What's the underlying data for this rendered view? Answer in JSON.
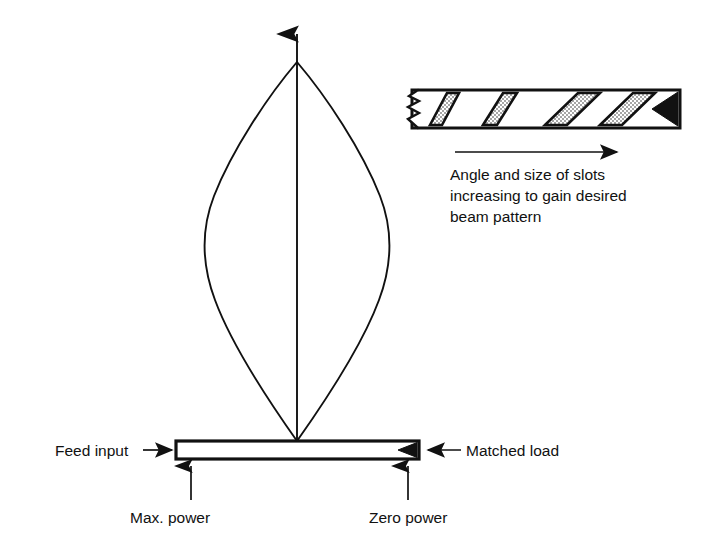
{
  "figure": {
    "type": "technical-diagram",
    "background_color": "#ffffff",
    "ink_color": "#111111"
  },
  "main_diagram": {
    "beam_lobe": {
      "name": "radiation-beam-pattern-lobe",
      "shape": "teardrop",
      "apex_label": null,
      "boresight_arrow": "upward"
    },
    "waveguide": {
      "name": "slotted-waveguide-bar",
      "fill": "#ffffff",
      "stroke": "#111111"
    },
    "labels": {
      "feed_input": "Feed input",
      "matched_load": "Matched load",
      "max_power": "Max. power",
      "zero_power": "Zero power"
    }
  },
  "inset_diagram": {
    "name": "waveguide-slot-detail",
    "break_symbol": "jagged-break",
    "slot_count": 5,
    "slot_fill": "stipple",
    "termination": "black-wedge-matched-load",
    "direction_arrow": "rightward",
    "caption_lines": [
      "Angle and size of slots",
      "increasing to gain desired",
      "beam pattern"
    ]
  }
}
